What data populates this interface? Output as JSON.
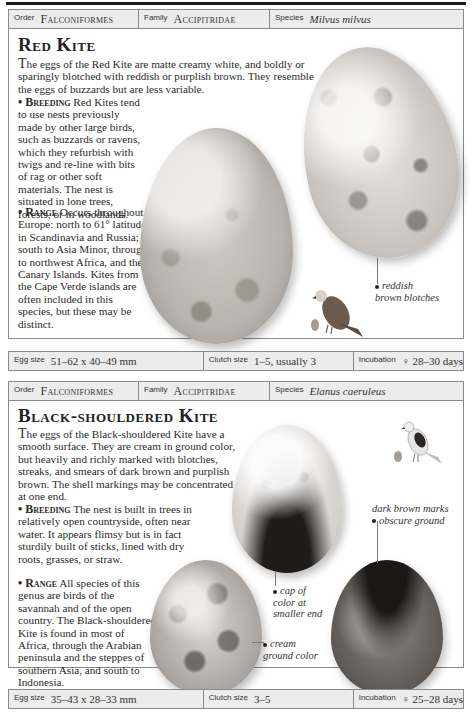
{
  "sections": [
    {
      "id": "red-kite",
      "taxonomy": {
        "order_label": "Order",
        "order": "Falconiformes",
        "family_label": "Family",
        "family": "Accipitridae",
        "species_label": "Species",
        "species": "Milvus milvus"
      },
      "title": "Red Kite",
      "intro_dropcap": "T",
      "intro": "he eggs of the Red Kite are matte creamy white, and boldly or sparingly blotched with reddish or purplish brown. They resemble the eggs of buzzards but are less variable.",
      "breeding_label": "Breeding",
      "breeding": "Red Kites tend to use nests previously made by other large birds, such as buzzards or ravens, which they refurbish with twigs and re-line with bits of rag or other soft materials. The nest is situated in lone trees, forests, or in woodlands.",
      "range_label": "Range",
      "range": "Occurs throughout Europe: north to 61° latitude in Scandinavia and Russia; south to Asia Minor, through to northwest Africa, and the Canary Islands. Kites from the Cape Verde islands are often included in this species, but these may be distinct.",
      "captions": [
        {
          "line1": "reddish",
          "line2": "brown blotches"
        }
      ],
      "stats": {
        "egg_size_label": "Egg size",
        "egg_size": "51–62 x 40–49 mm",
        "clutch_size_label": "Clutch size",
        "clutch_size": "1–5, usually 3",
        "incubation_label": "Incubation",
        "incubation": "♀ 28–30 days"
      },
      "images": [
        "egg-large",
        "egg-small",
        "bird-illustration",
        "egg-swatch"
      ],
      "colors": {
        "swatch": "#a89a94"
      }
    },
    {
      "id": "black-shouldered-kite",
      "taxonomy": {
        "order_label": "Order",
        "order": "Falconiformes",
        "family_label": "Family",
        "family": "Accipitridae",
        "species_label": "Species",
        "species": "Elanus caeruleus"
      },
      "title": "Black-shouldered Kite",
      "intro_dropcap": "T",
      "intro": "he eggs of the Black-shouldered Kite have a smooth surface. They are cream in ground color, but heavily and richly marked with blotches, streaks, and smears of dark brown and purplish brown. The shell markings may be concentrated at one end.",
      "breeding_label": "Breeding",
      "breeding": "The nest is built in trees in relatively open countryside, often near water. It appears flimsy but is in fact sturdily built of sticks, lined with dry roots, grasses, or straw.",
      "range_label": "Range",
      "range": "All species of this genus are birds of the savannah and of the open country. The Black-shouldered Kite is found in most of Africa, through the Arabian peninsula and the steppes of southern Asia, and south to Indonesia.",
      "captions": [
        {
          "line1": "dark brown marks",
          "line2": "obscure ground"
        },
        {
          "line1": "cap of",
          "line2": "color at",
          "line3": "smaller end"
        },
        {
          "line1": "cream",
          "line2": "ground color"
        }
      ],
      "stats": {
        "egg_size_label": "Egg size",
        "egg_size": "35–43 x 28–33 mm",
        "clutch_size_label": "Clutch size",
        "clutch_size": "3–5",
        "incubation_label": "Incubation",
        "incubation": "♀ 25–28 days"
      },
      "images": [
        "egg-capped",
        "egg-cream",
        "egg-dark",
        "bird-illustration",
        "egg-swatch"
      ],
      "colors": {
        "swatch": "#a89a94"
      }
    }
  ]
}
